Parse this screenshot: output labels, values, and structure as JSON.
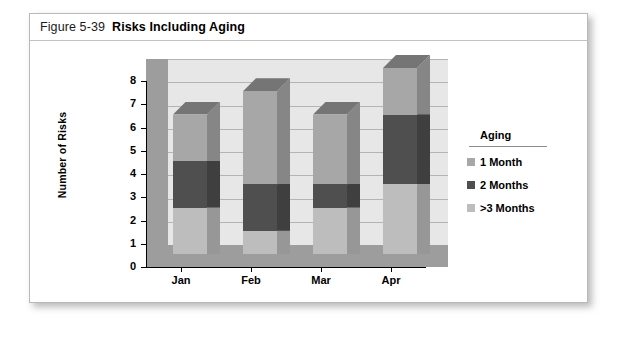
{
  "figure": {
    "number": "Figure 5-39",
    "title": "Risks Including Aging"
  },
  "legend": {
    "title": "Aging",
    "items": [
      {
        "label": "1 Month",
        "color": "#a7a7a7"
      },
      {
        "label": "2 Months",
        "color": "#4f4f4f"
      },
      {
        "label": ">3 Months",
        "color": "#bdbdbd"
      }
    ]
  },
  "colors": {
    "plot_back_wall": "#e7e7e7",
    "plot_side_wall": "#9d9d9d",
    "plot_floor": "#9d9d9d",
    "gridline": "#b4b4b4",
    "axis": "#000000",
    "card_border": "#b9b9b9",
    "series_1_month": "#a7a7a7",
    "series_2_months": "#4f4f4f",
    "series_3plus_months": "#bdbdbd"
  },
  "chart_data": {
    "type": "bar",
    "title": "Risks Including Aging",
    "xlabel": "",
    "ylabel": "Number of Risks",
    "ylim": [
      0,
      8
    ],
    "yticks": [
      0,
      1,
      2,
      3,
      4,
      5,
      6,
      7,
      8
    ],
    "grid": true,
    "stacked": true,
    "three_d": true,
    "legend_position": "right",
    "categories": [
      "Jan",
      "Feb",
      "Mar",
      "Apr"
    ],
    "series": [
      {
        "name": ">3 Months",
        "color": "#bdbdbd",
        "values": [
          2,
          1,
          2,
          3
        ]
      },
      {
        "name": "2 Months",
        "color": "#4f4f4f",
        "values": [
          2,
          2,
          1,
          3
        ]
      },
      {
        "name": "1 Month",
        "color": "#a7a7a7",
        "values": [
          2,
          4,
          3,
          2
        ]
      }
    ],
    "totals": [
      6,
      7,
      6,
      8
    ]
  }
}
